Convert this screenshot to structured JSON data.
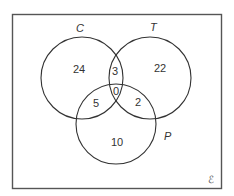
{
  "diagram": {
    "type": "venn",
    "universal_set": {
      "symbol": "ℰ"
    },
    "sets": [
      {
        "id": "C",
        "label": "C"
      },
      {
        "id": "T",
        "label": "T"
      },
      {
        "id": "P",
        "label": "P"
      }
    ],
    "regions": {
      "C_only": "24",
      "T_only": "22",
      "P_only": "10",
      "C_and_T_only": "3",
      "C_and_P_only": "5",
      "T_and_P_only": "2",
      "C_and_T_and_P": "0"
    },
    "colors": {
      "stroke": "#333333",
      "frame": "#555555",
      "background": "#ffffff"
    }
  }
}
